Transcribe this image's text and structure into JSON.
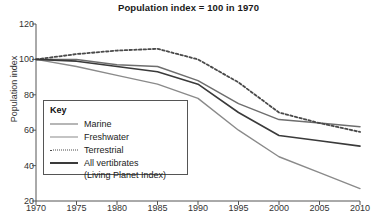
{
  "chart_data": {
    "type": "line",
    "title": "Population index = 100 in 1970",
    "xlabel": "",
    "ylabel": "Population index",
    "xlim": [
      1970,
      2010
    ],
    "ylim": [
      20,
      120
    ],
    "yticks": [
      20,
      40,
      60,
      80,
      100,
      120
    ],
    "xticks": [
      1970,
      1975,
      1980,
      1985,
      1990,
      1995,
      2000,
      2005,
      2010
    ],
    "grid": false,
    "legend_position": "inside-left",
    "legend_title": "Key",
    "x": [
      1970,
      1975,
      1980,
      1985,
      1990,
      1995,
      2000,
      2005,
      2010
    ],
    "series": [
      {
        "name": "Marine",
        "style": "solid",
        "color": "#6e6e6e",
        "width": 1.5,
        "values": [
          100,
          100,
          97,
          96,
          88,
          75,
          66,
          64,
          62
        ]
      },
      {
        "name": "Freshwater",
        "style": "solid",
        "color": "#8a8a8a",
        "width": 1.4,
        "values": [
          100,
          96,
          91,
          86,
          78,
          60,
          45,
          36,
          27
        ]
      },
      {
        "name": "Terrestrial",
        "style": "dotted",
        "color": "#4a4a4a",
        "width": 1.8,
        "values": [
          100,
          103,
          105,
          106,
          100,
          87,
          70,
          64,
          59
        ]
      },
      {
        "name": "All vertibrates",
        "style": "solid",
        "color": "#3a3a3a",
        "width": 1.6,
        "values": [
          100,
          99,
          96,
          93,
          86,
          70,
          57,
          54,
          51
        ]
      }
    ],
    "legend_entries": [
      {
        "label": "Marine",
        "style": "solid",
        "color": "#6e6e6e",
        "width": 1.6
      },
      {
        "label": "Freshwater",
        "style": "solid",
        "color": "#8a8a8a",
        "width": 1.4
      },
      {
        "label": "Terrestrial",
        "style": "dotted",
        "color": "#4a4a4a",
        "width": 1.8
      },
      {
        "label": "All vertibrates",
        "style": "solid",
        "color": "#3a3a3a",
        "width": 2.0
      }
    ],
    "legend_subnote": "(Living Planet Index)"
  }
}
